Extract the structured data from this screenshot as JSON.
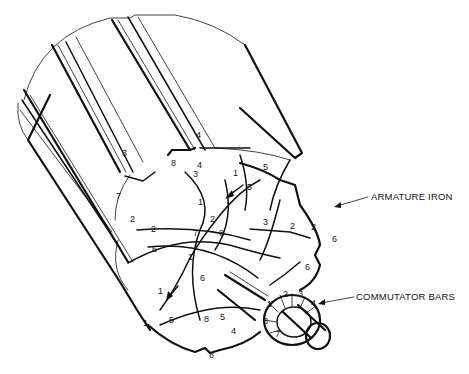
{
  "diagram": {
    "callouts": {
      "armature_iron": "ARMATURE IRON",
      "commutator_bars": "COMMUTATOR BARS"
    },
    "slot_labels": [
      {
        "text": "3",
        "x": 122,
        "y": 156
      },
      {
        "text": "3",
        "x": 193,
        "y": 177
      },
      {
        "text": "8",
        "x": 171,
        "y": 166
      },
      {
        "text": "4",
        "x": 196,
        "y": 138
      },
      {
        "text": "4",
        "x": 197,
        "y": 168
      },
      {
        "text": "5",
        "x": 263,
        "y": 170
      },
      {
        "text": "1",
        "x": 233,
        "y": 176
      },
      {
        "text": "5",
        "x": 247,
        "y": 190
      },
      {
        "text": "7",
        "x": 116,
        "y": 199
      },
      {
        "text": "1",
        "x": 198,
        "y": 205
      },
      {
        "text": "2",
        "x": 130,
        "y": 222
      },
      {
        "text": "2",
        "x": 151,
        "y": 232
      },
      {
        "text": "2",
        "x": 210,
        "y": 222
      },
      {
        "text": "7",
        "x": 193,
        "y": 236
      },
      {
        "text": "8",
        "x": 219,
        "y": 236
      },
      {
        "text": "3",
        "x": 263,
        "y": 225
      },
      {
        "text": "2",
        "x": 290,
        "y": 229
      },
      {
        "text": "2",
        "x": 311,
        "y": 230
      },
      {
        "text": "6",
        "x": 332,
        "y": 242
      },
      {
        "text": "6",
        "x": 152,
        "y": 252
      },
      {
        "text": "1",
        "x": 188,
        "y": 260
      },
      {
        "text": "6",
        "x": 200,
        "y": 281
      },
      {
        "text": "6",
        "x": 305,
        "y": 270
      },
      {
        "text": "1",
        "x": 158,
        "y": 294
      },
      {
        "text": "1",
        "x": 143,
        "y": 326
      },
      {
        "text": "5",
        "x": 169,
        "y": 323
      },
      {
        "text": "8",
        "x": 204,
        "y": 322
      },
      {
        "text": "5",
        "x": 220,
        "y": 320
      },
      {
        "text": "4",
        "x": 231,
        "y": 334
      },
      {
        "text": "8",
        "x": 209,
        "y": 358
      }
    ],
    "commutator_bar_labels": [
      {
        "text": "1",
        "x": 267,
        "y": 307
      },
      {
        "text": "2",
        "x": 283,
        "y": 297
      },
      {
        "text": "3",
        "x": 298,
        "y": 297
      },
      {
        "text": "4",
        "x": 311,
        "y": 306
      },
      {
        "text": "8",
        "x": 263,
        "y": 324
      },
      {
        "text": "7",
        "x": 275,
        "y": 337
      }
    ]
  }
}
